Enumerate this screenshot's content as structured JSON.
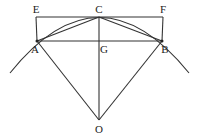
{
  "diagram": {
    "points": {
      "E": {
        "label": "E",
        "x": 36,
        "y": 17
      },
      "C": {
        "label": "C",
        "x": 99,
        "y": 17
      },
      "F": {
        "label": "F",
        "x": 163,
        "y": 17
      },
      "A": {
        "label": "A",
        "x": 37,
        "y": 41
      },
      "G": {
        "label": "G",
        "x": 99,
        "y": 41
      },
      "B": {
        "label": "B",
        "x": 162,
        "y": 41
      },
      "O": {
        "label": "O",
        "x": 99,
        "y": 120
      }
    },
    "segments": [
      "EF",
      "EA",
      "FB",
      "AB",
      "AC",
      "CB",
      "CO",
      "AO",
      "BO"
    ],
    "arc": {
      "center": "O",
      "through": [
        "A",
        "C",
        "B"
      ]
    },
    "stroke_color": "#333333"
  }
}
